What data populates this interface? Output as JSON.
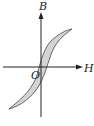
{
  "diagram": {
    "type": "hysteresis-loop",
    "labels": {
      "y_axis": "B",
      "x_axis": "H",
      "origin": "O"
    },
    "colors": {
      "loop_fill": "#d4d4d4",
      "loop_stroke": "#555555",
      "axis": "#222222"
    }
  }
}
